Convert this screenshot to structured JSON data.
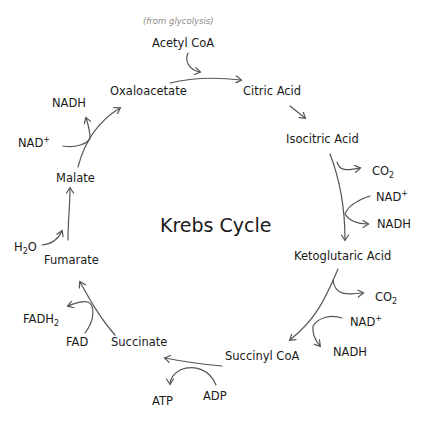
{
  "title": "Krebs Cycle",
  "annotation": "(from glycolysis)",
  "compounds": {
    "acetyl_coa": "Acetyl CoA",
    "oxaloacetate": "Oxaloacetate",
    "citric_acid": "Citric Acid",
    "isocitric_acid": "Isocitric Acid",
    "ketoglutaric_acid": "Ketoglutaric Acid",
    "succinyl_coa": "Succinyl CoA",
    "succinate": "Succinate",
    "fumarate": "Fumarate",
    "malate": "Malate"
  },
  "cofactors": {
    "co2_1": {
      "base": "CO",
      "sub": "2"
    },
    "nad_1": {
      "base": "NAD",
      "sup": "+"
    },
    "nadh_1": "NADH",
    "co2_2": {
      "base": "CO",
      "sub": "2"
    },
    "nad_2": {
      "base": "NAD",
      "sup": "+"
    },
    "nadh_2": "NADH",
    "adp": "ADP",
    "atp": "ATP",
    "fad": "FAD",
    "fadh2": {
      "base": "FADH",
      "sub": "2"
    },
    "h2o": {
      "pre": "H",
      "sub": "2",
      "post": "O"
    },
    "nad_3": {
      "base": "NAD",
      "sup": "+"
    },
    "nadh_3": "NADH"
  },
  "colors": {
    "text": "#1a1a1a",
    "arrow": "#555555",
    "annotation": "#8a8a8a",
    "background": "#ffffff"
  }
}
